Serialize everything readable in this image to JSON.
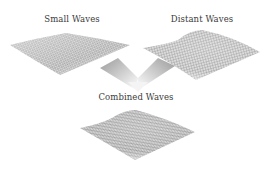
{
  "diagram": {
    "nodes": [
      {
        "id": "small",
        "label": "Small Waves",
        "texture": "fine-noise-mesh"
      },
      {
        "id": "distant",
        "label": "Distant Waves",
        "texture": "smooth-hill-mesh"
      },
      {
        "id": "combined",
        "label": "Combined Waves",
        "texture": "combined-mesh"
      }
    ],
    "edges": [
      {
        "from": "small",
        "to": "combined"
      },
      {
        "from": "distant",
        "to": "combined"
      }
    ],
    "arrow_icon": "merge-chevron-arrow",
    "colors": {
      "background": "#ffffff",
      "text": "#3a3a3a",
      "mesh_dark": "#7a7a7a",
      "mesh_light": "#d8d8d8",
      "arrow_start": "#9a9a9a",
      "arrow_end": "#ffffff"
    }
  }
}
